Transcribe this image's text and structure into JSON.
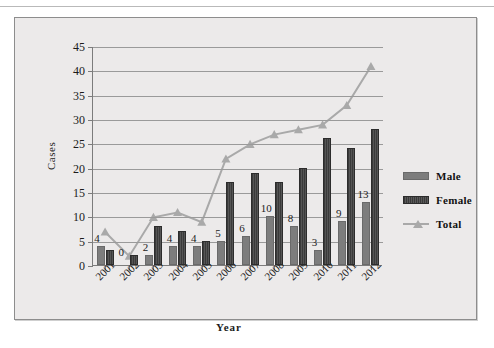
{
  "chart_data": {
    "type": "bar",
    "title": "",
    "xlabel": "Year",
    "ylabel": "Cases",
    "categories": [
      "2001",
      "2002",
      "2003",
      "2004",
      "2005",
      "2006",
      "2007",
      "2008",
      "2009",
      "2010",
      "2011",
      "2012"
    ],
    "series": [
      {
        "name": "Male",
        "type": "bar",
        "values": [
          4,
          0,
          2,
          4,
          4,
          5,
          6,
          10,
          8,
          3,
          9,
          13
        ],
        "color": "#7d7d7d",
        "data_labels": [
          "4",
          "0",
          "2",
          "4",
          "4",
          "5",
          "6",
          "10",
          "8",
          "3",
          "9",
          "13"
        ]
      },
      {
        "name": "Female",
        "type": "bar",
        "values": [
          3,
          2,
          8,
          7,
          5,
          17,
          19,
          17,
          20,
          26,
          24,
          28
        ],
        "color": "#3a3a3a"
      },
      {
        "name": "Total",
        "type": "line",
        "values": [
          7,
          2,
          10,
          11,
          9,
          22,
          25,
          27,
          28,
          29,
          33,
          41
        ],
        "color": "#a9a9a9",
        "marker": "triangle"
      }
    ],
    "ylim": [
      0,
      45
    ],
    "ytick_step": 5,
    "yticks": [
      "0",
      "5",
      "10",
      "15",
      "20",
      "25",
      "30",
      "35",
      "40",
      "45"
    ],
    "grid": true,
    "legend_position": "right"
  },
  "legend": {
    "items": [
      {
        "label": "Male",
        "swatch": "male-swatch"
      },
      {
        "label": "Female",
        "swatch": "female-swatch"
      },
      {
        "label": "Total",
        "swatch": "total-line-swatch"
      }
    ]
  }
}
